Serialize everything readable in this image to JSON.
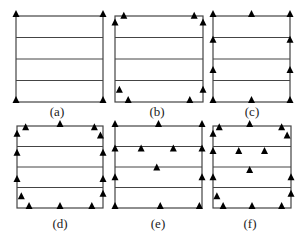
{
  "figure": {
    "line_color": "#444444",
    "marker_color": "#000000",
    "panels": [
      {
        "id": "a",
        "caption": "(a)",
        "box": {
          "x": 16,
          "y": 16,
          "w": 87,
          "h": 86
        },
        "caption_pos": {
          "x": 57,
          "y": 104
        },
        "markers": [
          [
            0,
            0
          ],
          [
            1,
            0
          ],
          [
            0,
            1
          ],
          [
            1,
            1
          ]
        ]
      },
      {
        "id": "b",
        "caption": "(b)",
        "box": {
          "x": 115,
          "y": 16,
          "w": 88,
          "h": 86
        },
        "caption_pos": {
          "x": 157,
          "y": 104
        },
        "markers": [
          [
            0.1,
            0.02
          ],
          [
            0,
            0.1
          ],
          [
            0.9,
            0.02
          ],
          [
            1,
            0.1
          ],
          [
            0.05,
            0.88
          ],
          [
            0.15,
            1
          ],
          [
            0.85,
            1
          ],
          [
            1,
            0.88
          ]
        ]
      },
      {
        "id": "c",
        "caption": "(c)",
        "box": {
          "x": 213,
          "y": 16,
          "w": 77,
          "h": 86
        },
        "caption_pos": {
          "x": 252,
          "y": 104
        },
        "markers": [
          [
            0,
            0
          ],
          [
            0.5,
            0
          ],
          [
            1,
            0
          ],
          [
            0,
            0.3
          ],
          [
            1,
            0.3
          ],
          [
            0,
            0.65
          ],
          [
            1,
            0.65
          ],
          [
            0,
            1
          ],
          [
            0.5,
            1
          ],
          [
            1,
            1
          ]
        ]
      },
      {
        "id": "d",
        "caption": "(d)",
        "box": {
          "x": 17,
          "y": 126,
          "w": 86,
          "h": 82
        },
        "caption_pos": {
          "x": 60,
          "y": 216
        },
        "markers": [
          [
            0.1,
            0.04
          ],
          [
            0.5,
            0.0
          ],
          [
            0.9,
            0.04
          ],
          [
            0,
            0.12
          ],
          [
            0.97,
            0.14
          ],
          [
            0,
            0.35
          ],
          [
            1,
            0.35
          ],
          [
            0,
            0.67
          ],
          [
            1,
            0.67
          ],
          [
            0.05,
            0.88
          ],
          [
            1,
            0.85
          ],
          [
            0.14,
            1
          ],
          [
            0.5,
            1
          ],
          [
            0.87,
            1
          ]
        ]
      },
      {
        "id": "e",
        "caption": "(e)",
        "box": {
          "x": 115,
          "y": 126,
          "w": 87,
          "h": 82
        },
        "caption_pos": {
          "x": 158,
          "y": 216
        },
        "markers": [
          [
            0,
            0
          ],
          [
            0.5,
            0
          ],
          [
            1,
            0
          ],
          [
            0,
            0.3
          ],
          [
            0.3,
            0.3
          ],
          [
            0.67,
            0.3
          ],
          [
            1,
            0.3
          ],
          [
            0.48,
            0.53
          ],
          [
            0,
            0.65
          ],
          [
            1,
            0.65
          ],
          [
            0,
            1
          ],
          [
            0.52,
            1
          ],
          [
            0.97,
            1
          ]
        ]
      },
      {
        "id": "f",
        "caption": "(f)",
        "box": {
          "x": 213,
          "y": 126,
          "w": 78,
          "h": 82
        },
        "caption_pos": {
          "x": 250,
          "y": 216
        },
        "markers": [
          [
            0.08,
            0.04
          ],
          [
            0.47,
            0.0
          ],
          [
            0.88,
            0.04
          ],
          [
            0,
            0.12
          ],
          [
            0.95,
            0.14
          ],
          [
            0,
            0.33
          ],
          [
            0.33,
            0.33
          ],
          [
            0.66,
            0.33
          ],
          [
            0.47,
            0.56
          ],
          [
            0,
            0.65
          ],
          [
            1,
            0.65
          ],
          [
            0.05,
            0.88
          ],
          [
            1,
            0.85
          ],
          [
            0.13,
            1
          ],
          [
            0.5,
            1
          ],
          [
            0.88,
            1
          ]
        ]
      }
    ]
  }
}
